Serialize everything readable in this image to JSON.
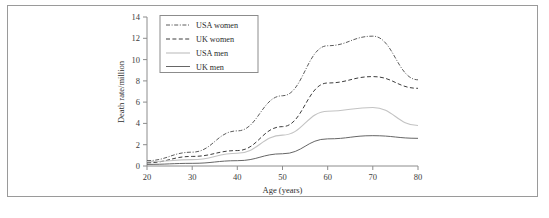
{
  "figure": {
    "border_color": "#9a9a9a",
    "background": "#ffffff"
  },
  "chart_data": {
    "type": "line",
    "title": "",
    "xlabel": "Age (years)",
    "ylabel": "Death rate/million",
    "xlim": [
      20,
      80
    ],
    "ylim": [
      0,
      14
    ],
    "xticks": [
      20,
      30,
      40,
      50,
      60,
      70,
      80
    ],
    "yticks": [
      0,
      2,
      4,
      6,
      8,
      10,
      12,
      14
    ],
    "grid": false,
    "legend_position": "top-left-inside",
    "x": [
      20,
      30,
      40,
      50,
      60,
      70,
      80
    ],
    "series": [
      {
        "name": "USA women",
        "values": [
          0.5,
          1.3,
          3.3,
          6.6,
          11.3,
          12.2,
          8.1
        ],
        "style": "dash-dot",
        "color": "#4a4a4a",
        "width": 0.9
      },
      {
        "name": "UK women",
        "values": [
          0.3,
          0.9,
          1.45,
          3.7,
          7.8,
          8.4,
          7.3
        ],
        "style": "dashed",
        "color": "#3d3d3d",
        "width": 1.0
      },
      {
        "name": "USA men",
        "values": [
          0.4,
          0.6,
          1.2,
          2.9,
          5.15,
          5.5,
          3.8
        ],
        "style": "solid-light",
        "color": "#c3c3c3",
        "width": 1.1
      },
      {
        "name": "UK men",
        "values": [
          0.15,
          0.25,
          0.5,
          1.15,
          2.55,
          2.85,
          2.6
        ],
        "style": "solid",
        "color": "#666666",
        "width": 1.0
      }
    ]
  },
  "legend": {
    "entries": [
      {
        "label": "USA women"
      },
      {
        "label": "UK women"
      },
      {
        "label": "USA men"
      },
      {
        "label": "UK men"
      }
    ]
  },
  "axis_labels": {
    "x_title": "Age (years)",
    "y_title": "Death rate/million",
    "x_ticks": [
      "20",
      "30",
      "40",
      "50",
      "60",
      "70",
      "80"
    ],
    "y_ticks": [
      "0",
      "2",
      "4",
      "6",
      "8",
      "10",
      "12",
      "14"
    ]
  },
  "caption": {
    "text": ""
  }
}
